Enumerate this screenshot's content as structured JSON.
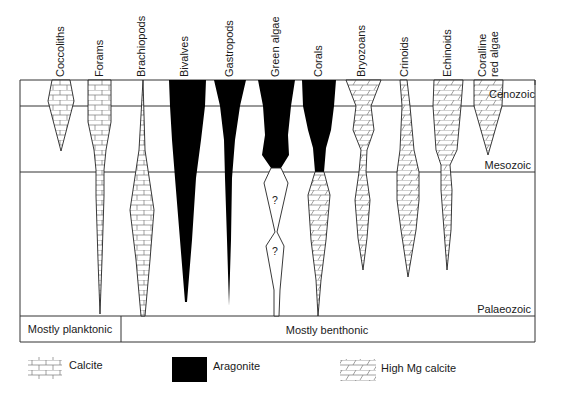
{
  "figure": {
    "columns": [
      {
        "id": "coccoliths",
        "label": "Coccoliths",
        "label_lines": [
          "Coccoliths"
        ],
        "x": 61,
        "mineral": "calcite"
      },
      {
        "id": "forams",
        "label": "Forams",
        "label_lines": [
          "Forams"
        ],
        "x": 99,
        "mineral": "calcite"
      },
      {
        "id": "brachiopods",
        "label": "Brachiopods",
        "label_lines": [
          "Brachiopods"
        ],
        "x": 143,
        "mineral": "calcite"
      },
      {
        "id": "bivalves",
        "label": "Bivalves",
        "label_lines": [
          "Bivalves"
        ],
        "x": 186,
        "mineral": "aragonite"
      },
      {
        "id": "gastropods",
        "label": "Gastropods",
        "label_lines": [
          "Gastropods"
        ],
        "x": 229,
        "mineral": "aragonite"
      },
      {
        "id": "green-algae",
        "label": "Green algae",
        "label_lines": [
          "Green algae"
        ],
        "x": 276,
        "mineral": "aragonite"
      },
      {
        "id": "corals",
        "label": "Corals",
        "label_lines": [
          "Corals"
        ],
        "x": 318,
        "mineral": "aragonite / high Mg calcite"
      },
      {
        "id": "bryozoans",
        "label": "Bryozoans",
        "label_lines": [
          "Bryozoans"
        ],
        "x": 363,
        "mineral": "high Mg calcite"
      },
      {
        "id": "crinoids",
        "label": "Crinoids",
        "label_lines": [
          "Crinoids"
        ],
        "x": 404,
        "mineral": "high Mg calcite"
      },
      {
        "id": "echinoids",
        "label": "Echinoids",
        "label_lines": [
          "Echinoids"
        ],
        "x": 447,
        "mineral": "high Mg calcite"
      },
      {
        "id": "coralline-red-algae",
        "label": "Coralline red algae",
        "label_lines": [
          "Coralline",
          "red algae"
        ],
        "x": 488,
        "mineral": "high Mg calcite"
      }
    ],
    "eras": [
      {
        "id": "cenozoic",
        "label": "Cenozoic"
      },
      {
        "id": "mesozoic",
        "label": "Mesozoic"
      },
      {
        "id": "palaeozoic",
        "label": "Palaeozoic"
      }
    ],
    "habitat": {
      "planktonic": "Mostly planktonic",
      "benthonic": "Mostly benthonic"
    },
    "unknown_marker": "?",
    "legend": [
      {
        "id": "calcite",
        "label": "Calcite",
        "pattern": "brick"
      },
      {
        "id": "aragonite",
        "label": "Aragonite",
        "pattern": "solid",
        "color": "#000000"
      },
      {
        "id": "high-mg-calcite",
        "label": "High Mg calcite",
        "pattern": "slanted-brick"
      }
    ],
    "colors": {
      "ink": "#1a1a1a",
      "aragonite": "#000000",
      "paper": "#ffffff",
      "pattern_line": "#888888"
    }
  }
}
